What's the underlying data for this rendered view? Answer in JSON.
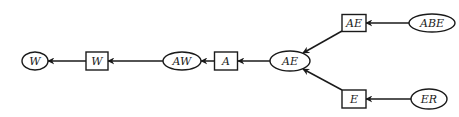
{
  "diagram": {
    "type": "directed-graph",
    "nodes": [
      {
        "id": "n_w_ellipse",
        "shape": "ellipse",
        "label": "W",
        "cx": 35,
        "cy": 61,
        "rx": 13,
        "ry": 9
      },
      {
        "id": "n_w_rect",
        "shape": "rect",
        "label": "W",
        "cx": 97,
        "cy": 61,
        "w": 22,
        "h": 18
      },
      {
        "id": "n_aw_ellipse",
        "shape": "ellipse",
        "label": "AW",
        "cx": 182,
        "cy": 61,
        "rx": 19,
        "ry": 9
      },
      {
        "id": "n_a_rect",
        "shape": "rect",
        "label": "A",
        "cx": 226,
        "cy": 61,
        "w": 23,
        "h": 18
      },
      {
        "id": "n_ae_ellipse",
        "shape": "ellipse",
        "label": "AE",
        "cx": 290,
        "cy": 61,
        "rx": 20,
        "ry": 10
      },
      {
        "id": "n_ae_rect",
        "shape": "rect",
        "label": "AE",
        "cx": 354,
        "cy": 23,
        "w": 24,
        "h": 17
      },
      {
        "id": "n_abe_ellipse",
        "shape": "ellipse",
        "label": "ABE",
        "cx": 432,
        "cy": 23,
        "rx": 23,
        "ry": 9
      },
      {
        "id": "n_e_rect",
        "shape": "rect",
        "label": "E",
        "cx": 354,
        "cy": 99,
        "w": 24,
        "h": 18
      },
      {
        "id": "n_er_ellipse",
        "shape": "ellipse",
        "label": "ER",
        "cx": 429,
        "cy": 99,
        "rx": 18,
        "ry": 10
      }
    ],
    "edges": [
      {
        "from": "n_w_rect",
        "to": "n_w_ellipse",
        "x1": 86,
        "y1": 61,
        "x2": 48,
        "y2": 61
      },
      {
        "from": "n_aw_ellipse",
        "to": "n_w_rect",
        "x1": 163,
        "y1": 61,
        "x2": 108,
        "y2": 61
      },
      {
        "from": "n_a_rect",
        "to": "n_aw_ellipse",
        "x1": 214,
        "y1": 61,
        "x2": 201,
        "y2": 61
      },
      {
        "from": "n_ae_ellipse",
        "to": "n_a_rect",
        "x1": 270,
        "y1": 61,
        "x2": 238,
        "y2": 61
      },
      {
        "from": "n_ae_rect",
        "to": "n_ae_ellipse",
        "x1": 342,
        "y1": 31,
        "x2": 303,
        "y2": 53
      },
      {
        "from": "n_e_rect",
        "to": "n_ae_ellipse",
        "x1": 342,
        "y1": 90,
        "x2": 303,
        "y2": 69
      },
      {
        "from": "n_abe_ellipse",
        "to": "n_ae_rect",
        "x1": 409,
        "y1": 23,
        "x2": 366,
        "y2": 23
      },
      {
        "from": "n_er_ellipse",
        "to": "n_e_rect",
        "x1": 411,
        "y1": 99,
        "x2": 366,
        "y2": 99
      }
    ]
  }
}
